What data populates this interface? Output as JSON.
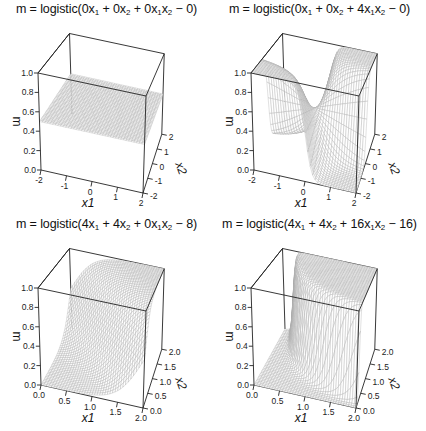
{
  "chart_data": [
    {
      "type": "surface",
      "title": "m = logistic(0x1 + 0x2 + 0x1x2 − 0)",
      "title_parts": {
        "a": "0",
        "b": "0",
        "c": "0",
        "d": "0"
      },
      "xlabel": "x1",
      "ylabel": "x2",
      "zlabel": "m",
      "xlim": [
        -2,
        2
      ],
      "ylim": [
        -2,
        2
      ],
      "zlim": [
        0,
        1
      ],
      "x_ticks": [
        "-2",
        "-1",
        "0",
        "1",
        "2"
      ],
      "y_ticks": [
        "-2",
        "-1",
        "0",
        "1",
        "2"
      ],
      "z_ticks": [
        "0.0",
        "0.2",
        "0.4",
        "0.6",
        "0.8",
        "1.0"
      ],
      "coefficients": {
        "x1": 0,
        "x2": 0,
        "x1x2": 0,
        "intercept": 0
      },
      "description": "Flat plane at m = 0.5"
    },
    {
      "type": "surface",
      "title": "m = logistic(0x1 + 0x2 + 4x1x2 − 0)",
      "title_parts": {
        "a": "0",
        "b": "0",
        "c": "4",
        "d": "0"
      },
      "xlabel": "x1",
      "ylabel": "x2",
      "zlabel": "m",
      "xlim": [
        -2,
        2
      ],
      "ylim": [
        -2,
        2
      ],
      "zlim": [
        0,
        1
      ],
      "x_ticks": [
        "-2",
        "-1",
        "0",
        "1",
        "2"
      ],
      "y_ticks": [
        "-2",
        "-1",
        "0",
        "1",
        "2"
      ],
      "z_ticks": [
        "0.0",
        "0.2",
        "0.4",
        "0.6",
        "0.8",
        "1.0"
      ],
      "coefficients": {
        "x1": 0,
        "x2": 0,
        "x1x2": 4,
        "intercept": 0
      },
      "description": "Saddle-shaped surface, high where x1*x2 > 0"
    },
    {
      "type": "surface",
      "title": "m = logistic(4x1 + 4x2 + 0x1x2 − 8)",
      "title_parts": {
        "a": "4",
        "b": "4",
        "c": "0",
        "d": "8"
      },
      "xlabel": "x1",
      "ylabel": "x2",
      "zlabel": "m",
      "xlim": [
        0,
        2
      ],
      "ylim": [
        0,
        2
      ],
      "zlim": [
        0,
        1
      ],
      "x_ticks": [
        "0.0",
        "0.5",
        "1.0",
        "1.5",
        "2.0"
      ],
      "y_ticks": [
        "0.0",
        "0.5",
        "1.0",
        "1.5",
        "2.0"
      ],
      "z_ticks": [
        "0.0",
        "0.2",
        "0.4",
        "0.6",
        "0.8",
        "1.0"
      ],
      "coefficients": {
        "x1": 4,
        "x2": 4,
        "x1x2": 0,
        "intercept": -8
      },
      "description": "Sigmoid ramp rising along x1 + x2 = 2"
    },
    {
      "type": "surface",
      "title": "m = logistic(4x1 + 4x2 + 16x1x2 − 16)",
      "title_parts": {
        "a": "4",
        "b": "4",
        "c": "16",
        "d": "16"
      },
      "xlabel": "x1",
      "ylabel": "x2",
      "zlabel": "m",
      "xlim": [
        0,
        2
      ],
      "ylim": [
        0,
        2
      ],
      "zlim": [
        0,
        1
      ],
      "x_ticks": [
        "0.0",
        "0.5",
        "1.0",
        "1.5",
        "2.0"
      ],
      "y_ticks": [
        "0.0",
        "0.5",
        "1.0",
        "1.5",
        "2.0"
      ],
      "z_ticks": [
        "0.0",
        "0.2",
        "0.4",
        "0.6",
        "0.8",
        "1.0"
      ],
      "coefficients": {
        "x1": 4,
        "x2": 4,
        "x1x2": 16,
        "intercept": -16
      },
      "description": "Sharp sigmoid wall following hyperbola-like boundary"
    }
  ],
  "style": {
    "box_color": "#222222",
    "mesh_color": "#a8a8a8",
    "background": "#ffffff"
  }
}
